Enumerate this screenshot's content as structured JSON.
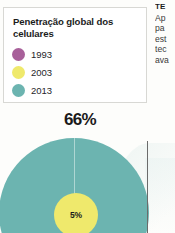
{
  "legend": {
    "title": "Penetração global dos celulares",
    "items": [
      {
        "label": "1993",
        "color": "#a8609a"
      },
      {
        "label": "2003",
        "color": "#efe96c"
      },
      {
        "label": "2013",
        "color": "#6cb4b0"
      }
    ]
  },
  "chart_data": {
    "type": "pie",
    "title": "Penetração global dos celulares",
    "xlabel": "",
    "ylabel": "",
    "categories": [
      "1993",
      "2003",
      "2013"
    ],
    "values": [
      null,
      5,
      66
    ],
    "value_labels": [
      "",
      "5%",
      "66%"
    ],
    "colors": [
      "#a8609a",
      "#efe96c",
      "#6cb4b0"
    ],
    "legend_position": "top-left",
    "grid": false,
    "note": "Concentric proportional circles; 1993 slice not visible in crop"
  },
  "bubbles": {
    "outer_label": "66%",
    "outer_color": "#6cb4b0",
    "inner_label": "5%",
    "inner_color": "#efe96c"
  },
  "article": {
    "heading": "TE",
    "lines": [
      "Ap",
      "pa",
      "est",
      "tec",
      "ava"
    ]
  }
}
